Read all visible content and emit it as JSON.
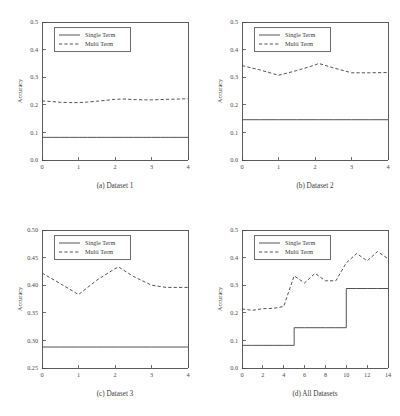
{
  "figure": {
    "name": "accuracy-comparison-figure",
    "panel_count": 4
  },
  "legend": {
    "single_label": "Single Term",
    "multi_label": "Multi Term"
  },
  "chart_data": [
    {
      "type": "line",
      "panel": "a",
      "title": "(a) Dataset 1",
      "xlabel": "",
      "ylabel": "Accuracy",
      "xlim": [
        0,
        4
      ],
      "ylim": [
        0.0,
        0.5
      ],
      "xticks": [
        0,
        1,
        2,
        3,
        4
      ],
      "xticklabels": [
        "0",
        "1",
        "2",
        "3",
        "4"
      ],
      "yticks": [
        0.0,
        0.1,
        0.2,
        0.3,
        0.4,
        0.5
      ],
      "yticklabels": [
        "0.0",
        "0.1",
        "0.2",
        "0.3",
        "0.4",
        "0.5"
      ],
      "grid": false,
      "legend_position": "upper-left",
      "x": [
        0,
        0.25,
        0.5,
        0.75,
        1,
        1.25,
        1.5,
        1.75,
        2,
        2.25,
        2.5,
        2.75,
        3,
        3.25,
        3.5,
        3.75,
        4
      ],
      "series": [
        {
          "name": "Single Term",
          "style": "solid",
          "values": [
            0.082,
            0.082,
            0.082,
            0.082,
            0.082,
            0.082,
            0.082,
            0.082,
            0.082,
            0.082,
            0.082,
            0.082,
            0.082,
            0.082,
            0.082,
            0.082,
            0.082
          ]
        },
        {
          "name": "Multi Term",
          "style": "dashed",
          "values": [
            0.214,
            0.212,
            0.209,
            0.208,
            0.208,
            0.21,
            0.213,
            0.216,
            0.22,
            0.221,
            0.219,
            0.218,
            0.218,
            0.219,
            0.22,
            0.221,
            0.222
          ]
        }
      ]
    },
    {
      "type": "line",
      "panel": "b",
      "title": "(b) Dataset 2",
      "xlabel": "",
      "ylabel": "Accuracy",
      "xlim": [
        0,
        4
      ],
      "ylim": [
        0.0,
        0.5
      ],
      "xticks": [
        0,
        1,
        2,
        3,
        4
      ],
      "xticklabels": [
        "0",
        "1",
        "2",
        "3",
        "4"
      ],
      "yticks": [
        0.0,
        0.1,
        0.2,
        0.3,
        0.4,
        0.5
      ],
      "yticklabels": [
        "0.0",
        "0.1",
        "0.2",
        "0.3",
        "0.4",
        "0.5"
      ],
      "grid": false,
      "legend_position": "upper-left",
      "x": [
        0,
        0.5,
        1,
        1.5,
        2,
        2.1,
        2.5,
        3,
        3.5,
        4
      ],
      "series": [
        {
          "name": "Single Term",
          "style": "solid",
          "values": [
            0.146,
            0.146,
            0.146,
            0.146,
            0.146,
            0.146,
            0.146,
            0.146,
            0.146,
            0.146
          ]
        },
        {
          "name": "Multi Term",
          "style": "dashed",
          "values": [
            0.342,
            0.326,
            0.307,
            0.324,
            0.344,
            0.35,
            0.334,
            0.316,
            0.316,
            0.317
          ]
        }
      ]
    },
    {
      "type": "line",
      "panel": "c",
      "title": "(c) Dataset 3",
      "xlabel": "",
      "ylabel": "Accuracy",
      "xlim": [
        0,
        4
      ],
      "ylim": [
        0.25,
        0.5
      ],
      "xticks": [
        0,
        1,
        2,
        3,
        4
      ],
      "xticklabels": [
        "0",
        "1",
        "2",
        "3",
        "4"
      ],
      "yticks": [
        0.25,
        0.3,
        0.35,
        0.4,
        0.45,
        0.5
      ],
      "yticklabels": [
        "0.25",
        "0.30",
        "0.35",
        "0.40",
        "0.45",
        "0.50"
      ],
      "grid": false,
      "legend_position": "upper-left",
      "x": [
        0,
        0.5,
        1,
        1.5,
        2,
        2.1,
        2.5,
        3,
        3.4,
        4
      ],
      "series": [
        {
          "name": "Single Term",
          "style": "solid",
          "values": [
            0.288,
            0.288,
            0.288,
            0.288,
            0.288,
            0.288,
            0.288,
            0.288,
            0.288,
            0.288
          ]
        },
        {
          "name": "Multi Term",
          "style": "dashed",
          "values": [
            0.422,
            0.403,
            0.383,
            0.409,
            0.43,
            0.433,
            0.416,
            0.4,
            0.396,
            0.396
          ]
        }
      ]
    },
    {
      "type": "line",
      "panel": "d",
      "title": "(d) All Datasets",
      "xlabel": "",
      "ylabel": "Accuracy",
      "xlim": [
        0,
        14
      ],
      "ylim": [
        0.0,
        0.5
      ],
      "xticks": [
        0,
        2,
        4,
        6,
        8,
        10,
        12,
        14
      ],
      "xticklabels": [
        "0",
        "2",
        "4",
        "6",
        "8",
        "10",
        "12",
        "14"
      ],
      "yticks": [
        0.0,
        0.1,
        0.2,
        0.3,
        0.4,
        0.5
      ],
      "yticklabels": [
        "0.0",
        "0.1",
        "0.2",
        "0.3",
        "0.4",
        "0.5"
      ],
      "grid": false,
      "legend_position": "upper-left",
      "x": [
        0,
        1,
        2,
        3,
        4,
        5,
        6,
        7,
        8,
        9,
        10,
        11,
        12,
        13,
        14
      ],
      "series": [
        {
          "name": "Single Term",
          "style": "solid-step",
          "values": [
            0.082,
            0.082,
            0.082,
            0.082,
            0.082,
            0.146,
            0.146,
            0.146,
            0.146,
            0.146,
            0.288,
            0.288,
            0.288,
            0.288,
            0.288
          ]
        },
        {
          "name": "Multi Term",
          "style": "dashed",
          "values": [
            0.214,
            0.209,
            0.215,
            0.216,
            0.223,
            0.334,
            0.308,
            0.343,
            0.316,
            0.316,
            0.381,
            0.415,
            0.388,
            0.422,
            0.396
          ]
        }
      ]
    }
  ]
}
